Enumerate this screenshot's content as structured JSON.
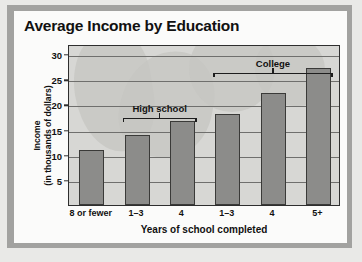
{
  "chart_data": {
    "type": "bar",
    "title": "Average Income by Education",
    "xlabel": "Years of school completed",
    "ylabel": "Income\n(in thousands of dollars)",
    "ylabel_line1": "Income",
    "ylabel_line2": "(in thousands of dollars)",
    "categories": [
      "8 or fewer",
      "1–3",
      "4",
      "1–3",
      "4",
      "5+"
    ],
    "values": [
      11,
      14,
      16.7,
      18,
      22.3,
      27.3
    ],
    "ylim": [
      0,
      32
    ],
    "yticks": [
      5,
      10,
      15,
      20,
      25,
      30
    ],
    "ytick_labels": [
      "5",
      "10",
      "15",
      "20",
      "25",
      "30"
    ],
    "grid": true,
    "legend": null,
    "bar_color": "#8c8c8a",
    "bar_edge_color": "#3a3a38",
    "plot_background": "#d7d7d4",
    "annotations": [
      {
        "label": "High school",
        "spans": [
          1,
          2
        ]
      },
      {
        "label": "College",
        "spans": [
          3,
          5
        ]
      }
    ]
  }
}
